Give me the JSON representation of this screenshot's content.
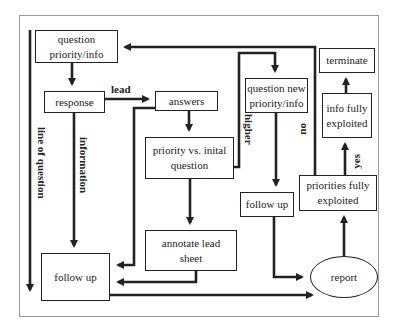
{
  "diagram": {
    "nodes": {
      "question_priority": "question priority/info",
      "question_priority_l1": "question",
      "question_priority_l2": "priority/info",
      "response": "response",
      "answers": "answers",
      "priority_vs_initial_l1": "priority vs. inital",
      "priority_vs_initial_l2": "question",
      "question_new_l1": "question new",
      "question_new_l2": "priority/info",
      "follow_up_right": "follow up",
      "annotate_l1": "annotate lead",
      "annotate_l2": "sheet",
      "follow_up_left": "follow up",
      "report": "report",
      "priorities_l1": "priorities fully",
      "priorities_l2": "exploited",
      "info_l1": "info fully",
      "info_l2": "exploited",
      "terminate": "terminate"
    },
    "edge_labels": {
      "lead": "lead",
      "information": "information",
      "line_of_question": "line of question",
      "higher": "higher",
      "no": "no",
      "yes": "yes"
    },
    "colors": {
      "stroke": "#222222",
      "frame": "#9a9a9a",
      "background": "#ffffff"
    }
  }
}
